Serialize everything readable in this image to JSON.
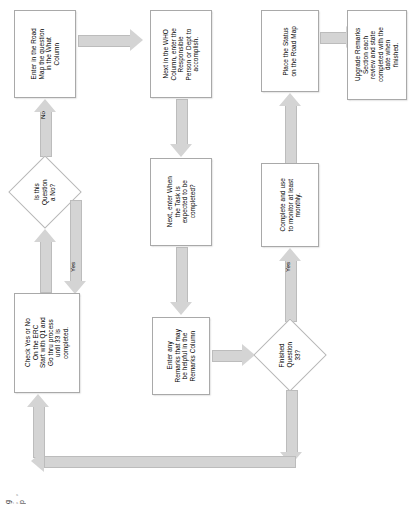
{
  "diagram": {
    "orientation": "rotated-90-ccw",
    "colors": {
      "node_fill": "#ffffff",
      "node_border": "#a9a9a9",
      "arrow_fill": "#d4d4d4",
      "arrow_border": "#bcbcbc",
      "text": "#000000",
      "background": "#ffffff"
    },
    "nodes": [
      {
        "id": "start",
        "type": "process",
        "label": "Check Yes or No\nOn the ERC\nStart with Q1 and\nGo thru process\nuntil 33 is\ncompleted."
      },
      {
        "id": "is-question-no",
        "type": "decision",
        "label": "Is this Question\na No?"
      },
      {
        "id": "enter-question",
        "type": "process",
        "label": "Enter in the Road\nMap the question\nin the What\nColumn"
      },
      {
        "id": "enter-who",
        "type": "process",
        "label": "Next in the WHO\nColumn, enter the\nResponsible\nPerson or Dept to\naccomplish."
      },
      {
        "id": "enter-when",
        "type": "process",
        "label": "Next, enter When\nthe Task is\nexpected to be\ncompleted?"
      },
      {
        "id": "enter-remarks",
        "type": "process",
        "label": "Enter any\nRemarks that may\nbe helpful in the\nRemarks Column"
      },
      {
        "id": "finished-q33",
        "type": "decision",
        "label": "Finished\nQuestion 33?"
      },
      {
        "id": "place-status",
        "type": "process",
        "label": "Place the Status\non the Road Map"
      },
      {
        "id": "upgrade-remarks",
        "type": "process",
        "label": "Upgrade Remarks\nSection each\nreview and state\ncompleted with the\ndate when\nfinished."
      },
      {
        "id": "complete-monitor",
        "type": "process",
        "label": "Complete and use\nto monitor at least\nmonthly."
      }
    ],
    "edges": [
      {
        "from": "start",
        "to": "is-question-no",
        "label": ""
      },
      {
        "from": "is-question-no",
        "to": "enter-question",
        "label": "No"
      },
      {
        "from": "is-question-no",
        "to": "start",
        "label": "Yes"
      },
      {
        "from": "enter-question",
        "to": "enter-who",
        "label": ""
      },
      {
        "from": "enter-who",
        "to": "enter-when",
        "label": ""
      },
      {
        "from": "enter-when",
        "to": "enter-remarks",
        "label": ""
      },
      {
        "from": "enter-remarks",
        "to": "finished-q33",
        "label": ""
      },
      {
        "from": "finished-q33",
        "to": "complete-monitor",
        "label": "Yes"
      },
      {
        "from": "complete-monitor",
        "to": "place-status",
        "label": ""
      },
      {
        "from": "place-status",
        "to": "upgrade-remarks",
        "label": ""
      },
      {
        "from": "finished-q33",
        "to": "start",
        "label": ""
      }
    ],
    "edge_labels": {
      "no": "No",
      "yes_loop_back": "Yes",
      "yes_finished": "Yes"
    },
    "footer_marks": "g  ;,  p"
  }
}
